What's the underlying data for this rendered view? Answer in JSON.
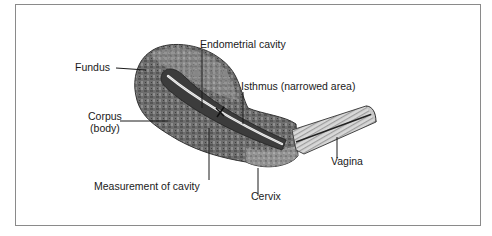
{
  "diagram": {
    "type": "anatomical illustration",
    "labels": {
      "fundus": "Fundus",
      "endometrial_cavity": "Endometrial cavity",
      "isthmus": "Isthmus (narrowed area)",
      "corpus_line1": "Corpus",
      "corpus_line2": "(body)",
      "measurement": "Measurement of cavity",
      "cervix": "Cervix",
      "vagina": "Vagina"
    },
    "colors": {
      "frame": "#8a8a8a",
      "tissue_dark": "#4a4a4a",
      "tissue_mid": "#7a7a7a",
      "tissue_light": "#b8b8b8",
      "cavity_line": "#f4f4f4",
      "text": "#1a1a1a"
    }
  }
}
